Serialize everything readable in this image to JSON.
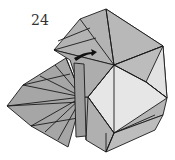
{
  "diagram": {
    "type": "origami-fold-step",
    "step_number": "24",
    "colors": {
      "paper_dark": "#a9a9a9",
      "paper_mid": "#b8b8b8",
      "paper_light": "#e4e4e4",
      "edge": "#1a1a1a",
      "arrow": "#111111"
    },
    "annotations": [
      "fold arrow pointing right"
    ]
  }
}
